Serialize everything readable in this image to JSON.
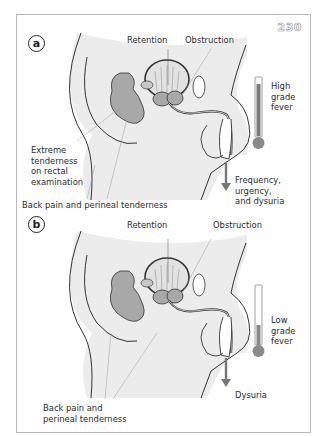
{
  "figure": {
    "number": "230",
    "colors": {
      "body_shade": "#ececec",
      "organ_fill": "#a8a8a8",
      "outline": "#333333",
      "thermometer_high": "#7a7a7a",
      "thermometer_low": "#8a8a8a",
      "border": "#b8b8b8"
    }
  },
  "panels": [
    {
      "id": "a",
      "badge": "a",
      "labels": {
        "retention": "Retention",
        "obstruction": "Obstruction",
        "rectal": "Extreme\ntenderness\non rectal\nexamination",
        "urinary": "Frequency, urgency,\nand dysuria",
        "back_pain": "Back pain and perineal tenderness",
        "fever": "High\ngrade\nfever"
      },
      "thermometer_level_pct": 85
    },
    {
      "id": "b",
      "badge": "b",
      "labels": {
        "retention": "Retention",
        "obstruction": "Obstruction",
        "urinary": "Dysuria",
        "back_pain": "Back pain and\nperineal tenderness",
        "fever": "Low\ngrade\nfever"
      },
      "thermometer_level_pct": 35
    }
  ]
}
